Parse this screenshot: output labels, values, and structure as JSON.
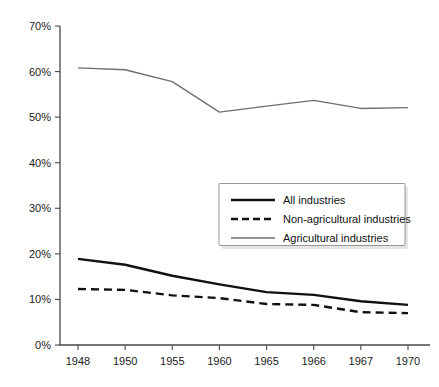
{
  "chart_data": {
    "type": "line",
    "title": "",
    "subtitle": "",
    "xlabel": "",
    "ylabel": "",
    "categories": [
      "1948",
      "1950",
      "1955",
      "1960",
      "1965",
      "1966",
      "1967",
      "1970"
    ],
    "ylim": [
      0,
      70
    ],
    "yticks": [
      0,
      10,
      20,
      30,
      40,
      50,
      60,
      70
    ],
    "ytick_labels": [
      "0%",
      "10%",
      "20%",
      "30%",
      "40%",
      "50%",
      "60%",
      "70%"
    ],
    "xtick_labels": [
      "1948",
      "1950",
      "1955",
      "1960",
      "1965",
      "1966",
      "1967",
      "1970"
    ],
    "grid": false,
    "legend_position": "center-right",
    "series": [
      {
        "name": "All industries",
        "style": "solid-thick",
        "color": "#111111",
        "values": [
          18.9,
          17.6,
          15.2,
          13.3,
          11.6,
          11.0,
          9.6,
          8.8
        ]
      },
      {
        "name": "Non-agricultural industries",
        "style": "dashed",
        "color": "#111111",
        "values": [
          12.3,
          12.1,
          10.9,
          10.3,
          9.0,
          8.8,
          7.2,
          7.0
        ]
      },
      {
        "name": "Agricultural industries",
        "style": "solid-thin",
        "color": "#6e6e6e",
        "values": [
          60.8,
          60.4,
          57.8,
          51.1,
          52.4,
          53.7,
          51.9,
          52.1
        ]
      }
    ]
  },
  "legend": {
    "items": [
      {
        "label": "All industries"
      },
      {
        "label": "Non-agricultural industries"
      },
      {
        "label": "Agricultural industries"
      }
    ]
  },
  "colors": {
    "background": "#ffffff",
    "axis": "#4a4a4a",
    "text": "#1a1a1a",
    "series_dark": "#111111",
    "series_gray": "#6e6e6e",
    "legend_border": "#8c8c8c"
  }
}
